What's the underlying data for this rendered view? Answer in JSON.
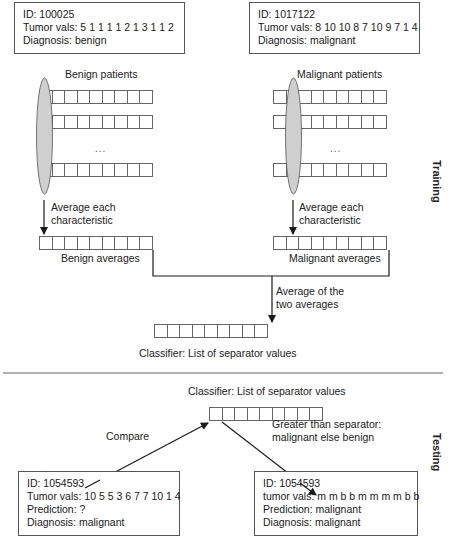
{
  "training": {
    "section_label": "Training",
    "benign_example": {
      "id": "ID: 100025",
      "tumor_vals": "Tumor vals: 5 1 1 1 1 2 1 3 1 1 2",
      "diagnosis": "Diagnosis: benign"
    },
    "malignant_example": {
      "id": "ID: 1017122",
      "tumor_vals": "Tumor vals: 8 10 10 8 7 10 9 7 1 4",
      "diagnosis": "Diagnosis: malignant"
    },
    "benign_group_label": "Benign patients",
    "malignant_group_label": "Malignant patients",
    "ellipsis": "...",
    "average_step_label_line1": "Average each",
    "average_step_label_line2": "characteristic",
    "benign_averages_label": "Benign averages",
    "malignant_averages_label": "Malignant averages",
    "combine_label_line1": "Average of the",
    "combine_label_line2": "two averages",
    "classifier_label": "Classifier: List of separator values",
    "cells_per_row": 9
  },
  "testing": {
    "section_label": "Testing",
    "classifier_label": "Classifier: List of separator values",
    "compare_label": "Compare",
    "rule_label_line1": "Greater than separator:",
    "rule_label_line2": "malignant else benign",
    "input_patient": {
      "id": "ID: 1054593",
      "tumor_vals": "Tumor vals: 10 5 5 3 6 7 7 10 1 4",
      "prediction": "Prediction: ?",
      "diagnosis": "Diagnosis: malignant"
    },
    "output_patient": {
      "id": "ID: 1054593",
      "tumor_vals": "tumor vals: m m b b m m m m b b",
      "prediction": "Prediction: malignant",
      "diagnosis": "Diagnosis: malignant"
    }
  },
  "colors": {
    "line": "#222222",
    "box_border": "#555555",
    "ellipse_fill": "#cfcfcf",
    "divider": "#666666"
  }
}
